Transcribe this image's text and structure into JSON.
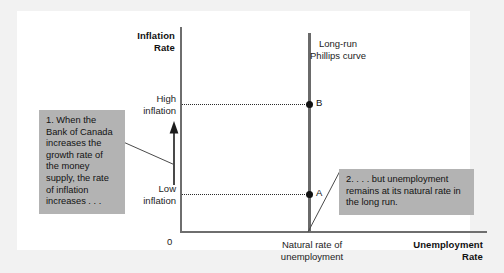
{
  "figure": {
    "type": "long-run-phillips-curve-diagram",
    "axes": {
      "y_title": "Inflation\nRate",
      "y_title_line1": "Inflation",
      "y_title_line2": "Rate",
      "x_title_line1": "Unemployment",
      "x_title_line2": "Rate",
      "origin_label": "0"
    },
    "y_ticks": [
      {
        "id": "high",
        "line1": "High",
        "line2": "inflation"
      },
      {
        "id": "low",
        "line1": "Low",
        "line2": "inflation"
      }
    ],
    "x_ticks": [
      {
        "id": "natural-rate",
        "line1": "Natural rate of",
        "line2": "unemployment"
      }
    ],
    "curve": {
      "label_line1": "Long-run",
      "label_line2": "Phillips curve"
    },
    "points": [
      {
        "id": "b",
        "label": "B",
        "inflation": "High inflation",
        "unemployment": "Natural rate of unemployment"
      },
      {
        "id": "a",
        "label": "A",
        "inflation": "Low inflation",
        "unemployment": "Natural rate of unemployment"
      }
    ],
    "annotations": [
      {
        "id": "callout-1",
        "text": "1. When the Bank of Canada increases the growth rate of the money supply, the rate of inflation increases . . ."
      },
      {
        "id": "callout-2",
        "text": "2. . . . but unemployment remains at its natural rate in the long run."
      }
    ],
    "colors": {
      "panel_background": "#ffffff",
      "outer_background": "#f2f2f2",
      "axis": "#6e6e6e",
      "curve": "#6a6a6a",
      "callout_background": "#b3b3b3",
      "text": "#121212"
    }
  }
}
